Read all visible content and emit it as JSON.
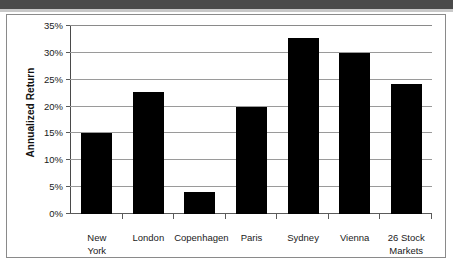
{
  "chart_data": {
    "type": "bar",
    "title": "",
    "xlabel": "",
    "ylabel": "Annualized Return",
    "categories": [
      "New York",
      "London",
      "Copenhagen",
      "Paris",
      "Sydney",
      "Vienna",
      "26 Stock Markets"
    ],
    "category_lines": [
      [
        "New",
        "York"
      ],
      [
        "London"
      ],
      [
        "Copenhagen"
      ],
      [
        "Paris"
      ],
      [
        "Sydney"
      ],
      [
        "Vienna"
      ],
      [
        "26 Stock",
        "Markets"
      ]
    ],
    "values": [
      15.0,
      22.8,
      4.1,
      19.9,
      32.7,
      29.9,
      24.2
    ],
    "value_labels": [
      "15%",
      "22.8%",
      "4.1%",
      "19.9%",
      "32.7%",
      "29.9%",
      "24.2%"
    ],
    "ylim": [
      0,
      35
    ],
    "ytick_values": [
      0,
      5,
      10,
      15,
      20,
      25,
      30,
      35
    ],
    "ytick_labels": [
      "0%",
      "5%",
      "10%",
      "15%",
      "20%",
      "25%",
      "30%",
      "35%"
    ],
    "grid": true,
    "legend": "none",
    "bar_color": "#000000",
    "gridline_color": "#9a9a9a",
    "axis_color": "#4a4a4a",
    "background_color": "#ffffff"
  }
}
